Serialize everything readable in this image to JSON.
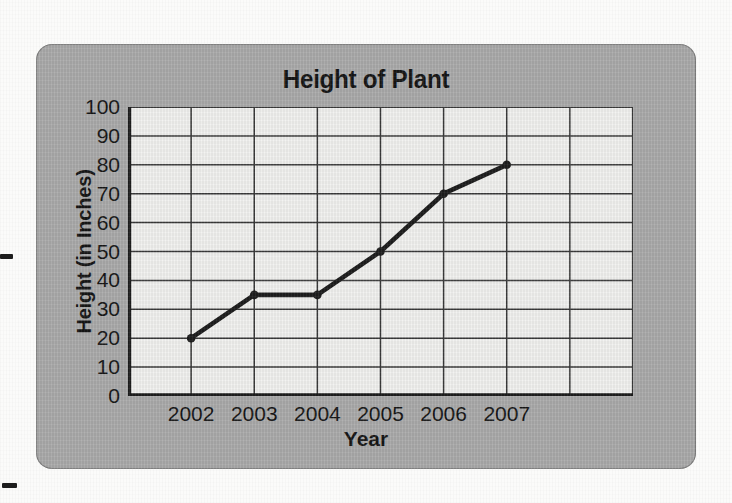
{
  "chart_data": {
    "type": "line",
    "title": "Height of Plant",
    "xlabel": "Year",
    "ylabel": "Height (in Inches)",
    "categories": [
      "2002",
      "2003",
      "2004",
      "2005",
      "2006",
      "2007"
    ],
    "values": [
      20,
      35,
      35,
      50,
      70,
      80
    ],
    "x_tick_labels": [
      "2002",
      "2003",
      "2004",
      "2005",
      "2006",
      "2007"
    ],
    "y_tick_labels": [
      "0",
      "10",
      "20",
      "30",
      "40",
      "50",
      "60",
      "70",
      "80",
      "90",
      "100"
    ],
    "y_ticks": [
      0,
      10,
      20,
      30,
      40,
      50,
      60,
      70,
      80,
      90,
      100
    ],
    "ylim": [
      0,
      100
    ],
    "grid": true,
    "legend": "none",
    "extra_empty_columns": 2,
    "total_columns": 8,
    "marker": "filled-circle",
    "line_color": "#1d1d1d",
    "grid_color": "#3a3a3a",
    "plot_background": "#f2f2f0",
    "panel_color": "#ababab",
    "axis_arrows": [
      "y-up",
      "x-right"
    ]
  },
  "panel": {
    "title": "Height of Plant",
    "y_axis_title": "Height (in Inches)",
    "x_axis_title": "Year"
  },
  "marks": {
    "left_edge_mark": "",
    "bottom_edge_mark": ""
  }
}
